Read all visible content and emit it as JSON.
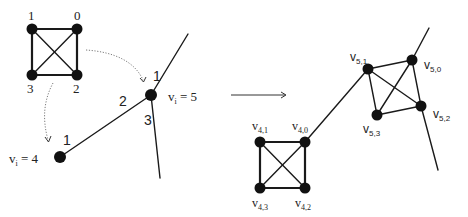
{
  "left_panel": {
    "k4_labels": {
      "n0": "0",
      "n1": "1",
      "n2": "2",
      "n3": "3"
    },
    "port_labels": {
      "p1": "1",
      "p2": "2",
      "p3": "3",
      "p1_left": "1"
    },
    "vertex_labels": {
      "v5": {
        "base": "v",
        "sub": "i",
        "eq": " = 5"
      },
      "v4": {
        "base": "v",
        "sub": "i",
        "eq": " = 4"
      }
    }
  },
  "arrow": {
    "symbol": "→"
  },
  "right_panel": {
    "labels": {
      "v40": {
        "base": "v",
        "sub": "4,0"
      },
      "v41": {
        "base": "v",
        "sub": "4,1"
      },
      "v42": {
        "base": "v",
        "sub": "4,2"
      },
      "v43": {
        "base": "v",
        "sub": "4,3"
      },
      "v50": {
        "base": "v",
        "sub": "5,0"
      },
      "v51": {
        "base": "v",
        "sub": "5,1"
      },
      "v52": {
        "base": "v",
        "sub": "5,2"
      },
      "v53": {
        "base": "v",
        "sub": "5,3"
      }
    }
  },
  "colors": {
    "ink": "#1a1a1a",
    "dotted": "#7a7a7a",
    "background": "#ffffff"
  }
}
